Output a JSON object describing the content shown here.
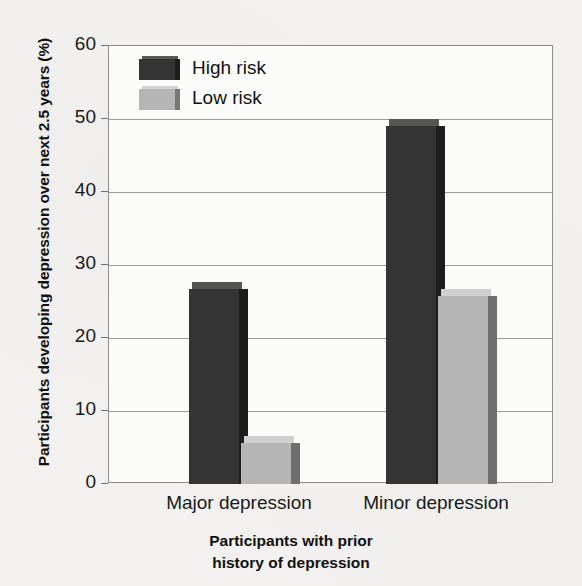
{
  "chart_data": {
    "type": "bar",
    "title": "",
    "subtitle": "",
    "categories": [
      "Major depression",
      "Minor depression"
    ],
    "series": [
      {
        "name": "High risk",
        "values": [
          26.7,
          49.0
        ],
        "color": "#343434"
      },
      {
        "name": "Low risk",
        "values": [
          5.6,
          25.8
        ],
        "color": "#b5b5b5"
      }
    ],
    "xlabel": "Participants with prior history of depression",
    "xlabel_lines": [
      "Participants with prior",
      "history of depression"
    ],
    "ylabel": "Participants developing depression over next 2.5 years (%)",
    "ylim": [
      0,
      60
    ],
    "yticks": [
      0,
      10,
      20,
      30,
      40,
      50,
      60
    ],
    "ytick_labels": [
      "0",
      "10",
      "20",
      "30",
      "40",
      "50",
      "60"
    ],
    "grid": "horizontal",
    "legend_position": "top-left inside plot",
    "style": "3d-bars"
  },
  "legend": {
    "items": [
      {
        "label": "High risk",
        "swatch": "dark-swatch-icon"
      },
      {
        "label": "Low risk",
        "swatch": "light-swatch-icon"
      }
    ]
  }
}
